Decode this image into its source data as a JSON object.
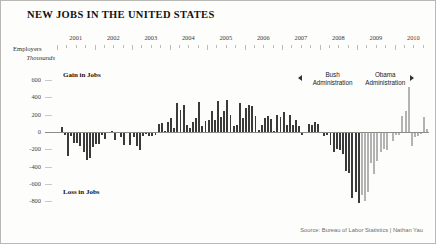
{
  "header": {
    "title": "NEW JOBS IN THE UNITED STATES"
  },
  "axis": {
    "y_label_line1": "Employers",
    "y_label_line2": "Thousands",
    "y_ticks": [
      "600",
      "400",
      "200",
      "0",
      "-200",
      "-400",
      "-600",
      "-800"
    ],
    "x_ticks": [
      "2001",
      "2002",
      "2003",
      "2004",
      "2005",
      "2006",
      "2007",
      "2008",
      "2009",
      "2010"
    ]
  },
  "annotations": {
    "gain_label": "Gain in Jobs",
    "loss_label": "Loss in Jobs",
    "bush_line1": "Bush",
    "bush_line2": "Administration",
    "obama_line1": "Obama",
    "obama_line2": "Administration",
    "left_arrow_icon": "triangle-left-icon",
    "right_arrow_icon": "triangle-right-icon"
  },
  "source": {
    "text": "Source: Bureau of Labor Statistics | Nathan Yau"
  },
  "colors": {
    "bush_bar": "#3a3a3a",
    "obama_bar": "#b3b3b3",
    "axis": "#8d8d88",
    "frame": "#b9b9b4",
    "background": "#fdfdfc"
  },
  "chart_data": {
    "type": "bar",
    "title": "NEW JOBS IN THE UNITED STATES",
    "xlabel": "",
    "ylabel": "Employers Thousands",
    "ylim": [
      -820,
      620
    ],
    "grid": false,
    "legend": "none",
    "unit": "thousands of jobs",
    "frequency": "monthly",
    "start": "2001-01",
    "end": "2010-11",
    "series": [
      {
        "name": "Bush Administration",
        "color": "#3a3a3a",
        "range": [
          "2001-01",
          "2009-01"
        ]
      },
      {
        "name": "Obama Administration",
        "color": "#b3b3b3",
        "range": [
          "2009-02",
          "2010-11"
        ]
      }
    ],
    "categories": [
      "2001-01",
      "2001-02",
      "2001-03",
      "2001-04",
      "2001-05",
      "2001-06",
      "2001-07",
      "2001-08",
      "2001-09",
      "2001-10",
      "2001-11",
      "2001-12",
      "2002-01",
      "2002-02",
      "2002-03",
      "2002-04",
      "2002-05",
      "2002-06",
      "2002-07",
      "2002-08",
      "2002-09",
      "2002-10",
      "2002-11",
      "2002-12",
      "2003-01",
      "2003-02",
      "2003-03",
      "2003-04",
      "2003-05",
      "2003-06",
      "2003-07",
      "2003-08",
      "2003-09",
      "2003-10",
      "2003-11",
      "2003-12",
      "2004-01",
      "2004-02",
      "2004-03",
      "2004-04",
      "2004-05",
      "2004-06",
      "2004-07",
      "2004-08",
      "2004-09",
      "2004-10",
      "2004-11",
      "2004-12",
      "2005-01",
      "2005-02",
      "2005-03",
      "2005-04",
      "2005-05",
      "2005-06",
      "2005-07",
      "2005-08",
      "2005-09",
      "2005-10",
      "2005-11",
      "2005-12",
      "2006-01",
      "2006-02",
      "2006-03",
      "2006-04",
      "2006-05",
      "2006-06",
      "2006-07",
      "2006-08",
      "2006-09",
      "2006-10",
      "2006-11",
      "2006-12",
      "2007-01",
      "2007-02",
      "2007-03",
      "2007-04",
      "2007-05",
      "2007-06",
      "2007-07",
      "2007-08",
      "2007-09",
      "2007-10",
      "2007-11",
      "2007-12",
      "2008-01",
      "2008-02",
      "2008-03",
      "2008-04",
      "2008-05",
      "2008-06",
      "2008-07",
      "2008-08",
      "2008-09",
      "2008-10",
      "2008-11",
      "2008-12",
      "2009-01",
      "2009-02",
      "2009-03",
      "2009-04",
      "2009-05",
      "2009-06",
      "2009-07",
      "2009-08",
      "2009-09",
      "2009-10",
      "2009-11",
      "2009-12",
      "2010-01",
      "2010-02",
      "2010-03",
      "2010-04",
      "2010-05",
      "2010-06",
      "2010-07",
      "2010-08",
      "2010-09",
      "2010-10",
      "2010-11"
    ],
    "values": [
      -16,
      60,
      -34,
      -281,
      -44,
      -128,
      -124,
      -166,
      -233,
      -325,
      -300,
      -177,
      -136,
      -144,
      -30,
      -85,
      -7,
      9,
      -97,
      -13,
      -56,
      -148,
      -14,
      -152,
      -59,
      -157,
      -212,
      -49,
      -20,
      -44,
      -48,
      -40,
      88,
      100,
      13,
      117,
      159,
      43,
      338,
      250,
      310,
      81,
      47,
      121,
      159,
      351,
      64,
      132,
      136,
      240,
      142,
      360,
      169,
      245,
      371,
      195,
      67,
      84,
      334,
      158,
      277,
      316,
      296,
      181,
      21,
      85,
      167,
      189,
      148,
      1,
      196,
      176,
      236,
      85,
      197,
      78,
      144,
      71,
      -33,
      -16,
      89,
      80,
      110,
      96,
      -10,
      -50,
      -33,
      -149,
      -231,
      -193,
      -210,
      -259,
      -452,
      -474,
      -765,
      -697,
      -818,
      -724,
      -799,
      -692,
      -361,
      -482,
      -339,
      -231,
      -199,
      -202,
      -7,
      -109,
      -40,
      -35,
      189,
      239,
      516,
      -167,
      -58,
      -51,
      -27,
      171,
      39
    ],
    "notable_points": [
      {
        "label": "Worst month",
        "date": "2009-01",
        "value": -818
      },
      {
        "label": "Census hiring peak",
        "date": "2010-05",
        "value": 516
      }
    ]
  }
}
